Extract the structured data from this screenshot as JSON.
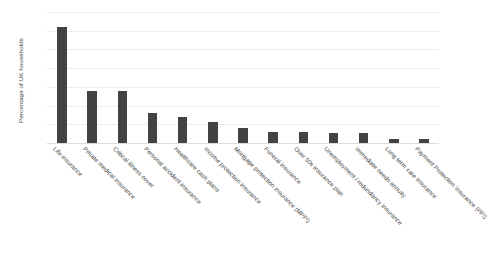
{
  "chart_data": {
    "type": "bar",
    "title": "",
    "subtitle": "",
    "xlabel": "",
    "ylabel": "Percentage of UK households",
    "ylim": [
      0,
      35
    ],
    "ytick_values": [
      0,
      5,
      10,
      15,
      20,
      25,
      30,
      35
    ],
    "ytick_labels": [
      "0%",
      "5%",
      "10%",
      "15%",
      "20%",
      "25%",
      "30%",
      "35%"
    ],
    "grid": true,
    "legend": false,
    "legend_position": "none",
    "bar_color": "#434343",
    "gridline_color": "#ededed",
    "background_color": "#ffffff",
    "categories": [
      "Life insurance",
      "Private medical insurance",
      "Critical illness cover",
      "Personal accident insurance",
      "Healthcare cash plans",
      "Income protection insurance",
      "Mortgage protection insurance (MPPI)",
      "Funeral insurance",
      "Over 50s insurance plan",
      "Unemployment / redundancy insurance",
      "Immediate needs annuity",
      "Long term care insurance",
      "Payment Protection Insurance (PPI)"
    ],
    "values": [
      31,
      14,
      14,
      8,
      7,
      5.5,
      4,
      3,
      3,
      2.8,
      2.8,
      1,
      1
    ]
  }
}
